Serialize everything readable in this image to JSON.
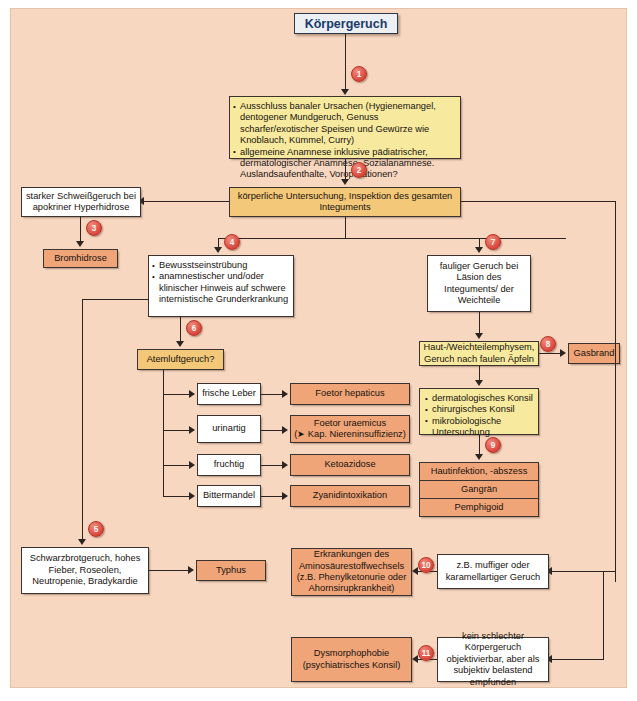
{
  "diagram": {
    "title": "Körpergeruch",
    "nodes": {
      "n1_history": {
        "bullets": [
          "Ausschluss banaler Ursachen (Hygienemangel, dentogener Mundgeruch, Genuss scharfer/exotischer Speisen und Gewürze wie Knoblauch, Kümmel, Curry)",
          "allgemeine Anamnese inklusive pädiatrischer, dermatologischer Anamnese, Sozialanamnese. Auslandsaufenthalte, Voroperationen?"
        ]
      },
      "n2_exam": "körperliche Untersuchung, Inspektion des gesamten Integuments",
      "sweat": "starker Schweißgeruch bei apokriner Hyperhidrose",
      "bromhidrose": "Bromhidrose",
      "n4_findings": {
        "bullets": [
          "Bewusstseinstrübung",
          "anamnestischer und/oder klinischer Hinweis auf schwere internistische Grunderkrankung"
        ]
      },
      "n6_breath": "Atemluftgeruch?",
      "breath_branches": [
        {
          "cue": "frische Leber",
          "result": "Foetor hepaticus"
        },
        {
          "cue": "urinartig",
          "result": "Foetor uraemicus\n(➤ Kap. Niereninsuffizienz)"
        },
        {
          "cue": "fruchtig",
          "result": "Ketoazidose"
        },
        {
          "cue": "Bittermandel",
          "result": "Zyanidintoxikation"
        }
      ],
      "n7_putrid": "fauliger Geruch bei Läsion des Integuments/ der Weichteile",
      "emphysema": "Haut-/Weichteilemphysem, Geruch nach faulen Äpfeln",
      "gasbrand": "Gasbrand",
      "consils": {
        "bullets": [
          "dermatologisches Konsil",
          "chirurgisches Konsil",
          "mikrobiologische Untersuchung"
        ]
      },
      "n9_results": [
        "Hautinfektion, -abszess",
        "Gangrän",
        "Pemphigoid"
      ],
      "n5_typhus_signs": "Schwarzbrotgeruch, hohes Fieber, Roseolen, Neutropenie, Bradykardie",
      "typhus": "Typhus",
      "aminoacid": "Erkrankungen des Aminosäurestoffwechsels (z.B. Phenylketonurie oder Ahornsirupkrankheit)",
      "musty": "z.B. muffiger oder karamellartiger Geruch",
      "dysmorphophobie": "Dysmorphophobie (psychiatrisches Konsil)",
      "subjective": "kein schlechter Körpergeruch objektivierbar, aber als subjektiv belastend empfunden"
    },
    "markers": {
      "m1": "1",
      "m2": "2",
      "m3": "3",
      "m4": "4",
      "m5": "5",
      "m6": "6",
      "m7": "7",
      "m8": "8",
      "m9": "9",
      "m10": "10",
      "m11": "11"
    },
    "colors": {
      "page_background": "#f7d7c0",
      "title_fill": "#eceff3",
      "title_text": "#1a3a6b",
      "yellow_fill": "#f7ea9e",
      "amber_fill": "#f3c878",
      "orange_fill": "#f0a578",
      "white_fill": "#ffffff",
      "marker_fill": "#d9453a",
      "line": "#2b2422"
    }
  }
}
